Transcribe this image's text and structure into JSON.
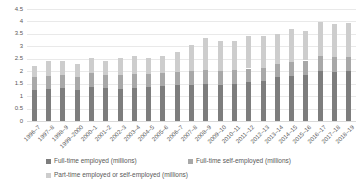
{
  "chart_data": {
    "type": "bar",
    "stacked": true,
    "title": "",
    "xlabel": "",
    "ylabel": "",
    "ylim": [
      0,
      4.5
    ],
    "ytick_labels": [
      "0",
      "0.5",
      "1",
      "1.5",
      "2",
      "2.5",
      "3",
      "3.5",
      "4",
      "4.5"
    ],
    "grid": true,
    "legend_position": "bottom",
    "categories": [
      "1996–7",
      "1997–8",
      "1998–9",
      "1999–2000",
      "2000–1",
      "2001–2",
      "2002–3",
      "2003–4",
      "2004–5",
      "2005–6",
      "2006–7",
      "2007–8",
      "2008–9",
      "2009–10",
      "2010–11",
      "2011–12",
      "2012–13",
      "2013–14",
      "2014–15",
      "2015–16",
      "2016–17",
      "2017–18",
      "2018–19"
    ],
    "series": [
      {
        "name": "Full-time employed (millions)",
        "color": "#7d7d7d",
        "values": [
          1.25,
          1.3,
          1.32,
          1.26,
          1.37,
          1.32,
          1.3,
          1.33,
          1.36,
          1.4,
          1.43,
          1.46,
          1.5,
          1.46,
          1.5,
          1.56,
          1.59,
          1.75,
          1.8,
          1.85,
          2.0,
          1.98,
          2.0
        ]
      },
      {
        "name": "Full-time self-employed (millions)",
        "color": "#a8a8a8",
        "values": [
          0.5,
          0.52,
          0.53,
          0.52,
          0.55,
          0.54,
          0.55,
          0.55,
          0.54,
          0.54,
          0.54,
          0.54,
          0.54,
          0.54,
          0.54,
          0.55,
          0.54,
          0.55,
          0.58,
          0.58,
          0.6,
          0.58,
          0.58
        ]
      },
      {
        "name": "Part-time employed or self-employed (millions)",
        "color": "#cdcdcd",
        "values": [
          0.45,
          0.58,
          0.57,
          0.5,
          0.6,
          0.56,
          0.69,
          0.74,
          0.63,
          0.67,
          0.8,
          1.07,
          1.29,
          1.21,
          1.17,
          1.29,
          1.27,
          1.21,
          1.3,
          1.17,
          1.38,
          1.34,
          1.35
        ]
      }
    ],
    "totals": [
      2.2,
      2.4,
      2.42,
      2.28,
      2.52,
      2.42,
      2.54,
      2.62,
      2.53,
      2.61,
      2.77,
      3.07,
      3.33,
      3.21,
      3.21,
      3.4,
      3.4,
      3.51,
      3.68,
      3.6,
      3.98,
      3.9,
      3.93
    ]
  },
  "colors": {
    "gridline": "#e9e9e9",
    "axis_line": "#d9d9d9",
    "text": "#595959",
    "background": "#ffffff"
  }
}
